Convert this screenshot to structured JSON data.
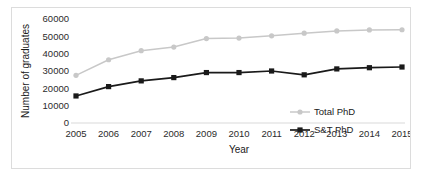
{
  "chart_data": {
    "type": "line",
    "title": "",
    "xlabel": "Year",
    "ylabel": "Number of graduates",
    "categories": [
      2005,
      2006,
      2007,
      2008,
      2009,
      2010,
      2011,
      2012,
      2013,
      2014,
      2015
    ],
    "x_tick_labels": [
      "2005",
      "2006",
      "2007",
      "2008",
      "2009",
      "2010",
      "2011",
      "2012",
      "2013",
      "2014",
      "2015"
    ],
    "y_tick_labels": [
      "0",
      "10000",
      "20000",
      "30000",
      "40000",
      "50000",
      "60000"
    ],
    "y_ticks": [
      0,
      10000,
      20000,
      30000,
      40000,
      50000,
      60000
    ],
    "ylim": [
      0,
      60000
    ],
    "grid": false,
    "legend_position": "inside-bottom-right",
    "series": [
      {
        "name": "Total PhD",
        "color": "#c8c8c8",
        "marker": "circle",
        "values": [
          27500,
          36500,
          41700,
          43800,
          48700,
          49000,
          50300,
          51800,
          53100,
          53700,
          53800
        ]
      },
      {
        "name": "S&T PhD",
        "color": "#1a1a1a",
        "marker": "square",
        "values": [
          15600,
          21000,
          24300,
          26200,
          29100,
          29100,
          30000,
          27800,
          31200,
          31900,
          32300
        ]
      }
    ]
  },
  "legend": {
    "items": [
      {
        "label": "Total PhD"
      },
      {
        "label": "S&T PhD"
      }
    ]
  },
  "colors": {
    "total_phd": "#c8c8c8",
    "st_phd": "#1a1a1a",
    "axis": "#d9d9d9",
    "frame_border": "#dcdcdc",
    "text": "#1a1a1a"
  }
}
